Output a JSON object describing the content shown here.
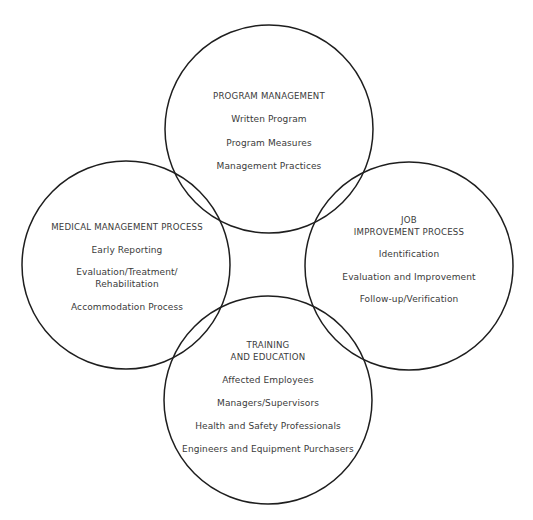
{
  "diagram": {
    "type": "four-circle overlapping venn",
    "stroke_color": "#1e1e1e",
    "text_color": "#3a3a3a",
    "background": "#ffffff",
    "circles": [
      {
        "id": "program-management",
        "cx": 269,
        "cy": 129,
        "r": 104,
        "title_lines": [
          "PROGRAM MANAGEMENT"
        ],
        "items": [
          "Written Program",
          "Program Measures",
          "Management Practices"
        ]
      },
      {
        "id": "medical-management",
        "cx": 126,
        "cy": 265,
        "r": 104,
        "title_lines": [
          "MEDICAL MANAGEMENT PROCESS"
        ],
        "items": [
          "Early Reporting",
          "Evaluation/Treatment/",
          "Rehabilitation",
          "Accommodation Process"
        ]
      },
      {
        "id": "job-improvement",
        "cx": 409,
        "cy": 266,
        "r": 104,
        "title_lines": [
          "JOB",
          "IMPROVEMENT PROCESS"
        ],
        "items": [
          "Identification",
          "Evaluation and Improvement",
          "Follow-up/Verification"
        ]
      },
      {
        "id": "training-education",
        "cx": 268,
        "cy": 400,
        "r": 104,
        "title_lines": [
          "TRAINING",
          "AND EDUCATION"
        ],
        "items": [
          "Affected Employees",
          "Managers/Supervisors",
          "Health and Safety Professionals",
          "Engineers and Equipment Purchasers"
        ]
      }
    ]
  }
}
